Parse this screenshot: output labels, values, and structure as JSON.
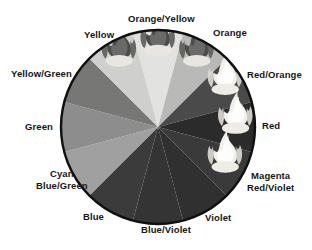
{
  "figure": {
    "type": "color-wheel-diagram",
    "background": "#ffffff",
    "outline_color": "#111111",
    "center": {
      "x": 158,
      "y": 127
    },
    "radius": 97
  },
  "chart_data": {
    "type": "pie",
    "xlabel": "",
    "ylabel": "",
    "legend_position": "around-perimeter",
    "grid": false,
    "note": "Twelve equal 30-degree segments rendered in grayscale; flame icons overlay the six warm segments.",
    "categories": [
      "Orange/Yellow",
      "Orange",
      "Red/Orange",
      "Red",
      "Magenta Red/Violet",
      "Violet",
      "Blue/Violet",
      "Blue",
      "Cyan Blue/Green",
      "Green",
      "Yellow/Green",
      "Yellow"
    ],
    "values": [
      30,
      30,
      30,
      30,
      30,
      30,
      30,
      30,
      30,
      30,
      30,
      30
    ],
    "segments": [
      {
        "index": 0,
        "label": "Orange/Yellow",
        "start_angle": -105,
        "end_angle": -75,
        "fill": "#e2e2e0",
        "flame": true,
        "flame_tone": "dark"
      },
      {
        "index": 1,
        "label": "Orange",
        "start_angle": -75,
        "end_angle": -45,
        "fill": "#b9b9b7",
        "flame": true,
        "flame_tone": "dark"
      },
      {
        "index": 2,
        "label": "Red/Orange",
        "start_angle": -45,
        "end_angle": -15,
        "fill": "#4a4a4a",
        "flame": true,
        "flame_tone": "light"
      },
      {
        "index": 3,
        "label": "Red",
        "start_angle": -15,
        "end_angle": 15,
        "fill": "#2b2b2b",
        "flame": true,
        "flame_tone": "light"
      },
      {
        "index": 4,
        "label": "Magenta Red/Violet",
        "start_angle": 15,
        "end_angle": 45,
        "fill": "#3a3a3a",
        "flame": true,
        "flame_tone": "light"
      },
      {
        "index": 5,
        "label": "Violet",
        "start_angle": 45,
        "end_angle": 75,
        "fill": "#303030",
        "flame": false,
        "flame_tone": ""
      },
      {
        "index": 6,
        "label": "Blue/Violet",
        "start_angle": 75,
        "end_angle": 105,
        "fill": "#343434",
        "flame": false,
        "flame_tone": ""
      },
      {
        "index": 7,
        "label": "Blue",
        "start_angle": 105,
        "end_angle": 135,
        "fill": "#3b3b3b",
        "flame": false,
        "flame_tone": ""
      },
      {
        "index": 8,
        "label": "Cyan Blue/Green",
        "start_angle": 135,
        "end_angle": 165,
        "fill": "#a0a0a0",
        "flame": false,
        "flame_tone": ""
      },
      {
        "index": 9,
        "label": "Green",
        "start_angle": 165,
        "end_angle": 195,
        "fill": "#8d8d8d",
        "flame": false,
        "flame_tone": ""
      },
      {
        "index": 10,
        "label": "Yellow/Green",
        "start_angle": 195,
        "end_angle": 225,
        "fill": "#777776",
        "flame": false,
        "flame_tone": ""
      },
      {
        "index": 11,
        "label": "Yellow",
        "start_angle": 225,
        "end_angle": 255,
        "fill": "#cfcfcd",
        "flame": true,
        "flame_tone": "dark"
      }
    ]
  },
  "labels": {
    "yellow": "Yellow",
    "orange_yellow": "Orange/Yellow",
    "orange": "Orange",
    "red_orange": "Red/Orange",
    "red": "Red",
    "magenta_line1": "Magenta",
    "magenta_line2": "Red/Violet",
    "violet": "Violet",
    "blue_violet": "Blue/Violet",
    "blue": "Blue",
    "cyan_line1": "Cyan",
    "cyan_line2": "Blue/Green",
    "green": "Green",
    "yellow_green": "Yellow/Green"
  }
}
